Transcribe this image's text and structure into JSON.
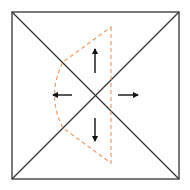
{
  "diagram": {
    "canvas": {
      "width": 190,
      "height": 190,
      "background": "#ffffff"
    },
    "square": {
      "x1": 12,
      "y1": 12,
      "x2": 179,
      "y2": 179,
      "stroke": "#333333",
      "stroke_width": 1.3
    },
    "diagonals": [
      {
        "x1": 12,
        "y1": 12,
        "x2": 179,
        "y2": 179
      },
      {
        "x1": 12,
        "y1": 179,
        "x2": 179,
        "y2": 12
      }
    ],
    "dashed_region": {
      "stroke": "#ec8a4e",
      "stroke_width": 1.2,
      "dasharray": "4,3",
      "path": "M111,27 L111,163 L63,128 Q46,95 63,62 Z"
    },
    "arrows": [
      {
        "name": "up",
        "x1": 95,
        "y1": 73,
        "x2": 95,
        "y2": 49
      },
      {
        "name": "down",
        "x1": 95,
        "y1": 118,
        "x2": 95,
        "y2": 141
      },
      {
        "name": "left",
        "x1": 72,
        "y1": 95,
        "x2": 53,
        "y2": 95
      },
      {
        "name": "right",
        "x1": 118,
        "y1": 95,
        "x2": 138,
        "y2": 95
      }
    ],
    "arrow_color": "#111111"
  }
}
